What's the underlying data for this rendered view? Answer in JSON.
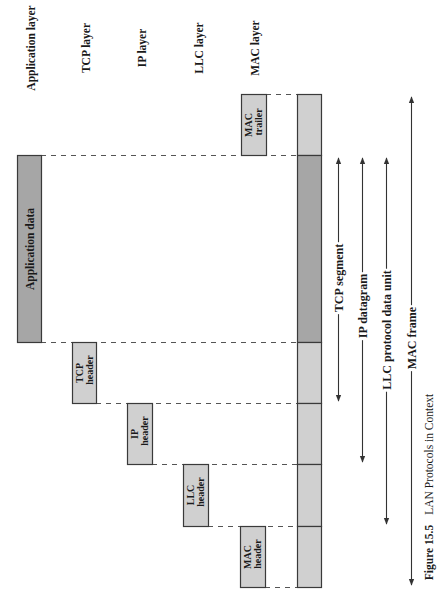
{
  "layers": {
    "application": "Application layer",
    "tcp": "TCP layer",
    "ip": "IP layer",
    "llc": "LLC layer",
    "mac": "MAC layer"
  },
  "blocks": {
    "application_data": "Application data",
    "tcp_header": [
      "TCP",
      "header"
    ],
    "ip_header": [
      "IP",
      "header"
    ],
    "llc_header": [
      "LLC",
      "header"
    ],
    "mac_header": [
      "MAC",
      "header"
    ],
    "mac_trailer": [
      "MAC",
      "trailer"
    ]
  },
  "spans": {
    "tcp_segment": "TCP segment",
    "ip_datagram": "IP datagram",
    "llc_pdu": "LLC protocol data unit",
    "mac_frame": "MAC frame"
  },
  "caption": {
    "number": "Figure 15.5",
    "title": "LAN Protocols in Context"
  },
  "colors": {
    "data_fill": "#a6a6a6",
    "header_fill": "#d0d0d0",
    "border": "#3a3a3a",
    "line": "#333333"
  }
}
